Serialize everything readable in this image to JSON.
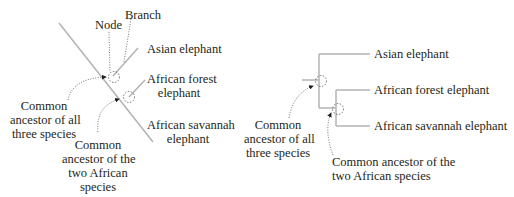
{
  "left_diagram": {
    "labels": {
      "node": "Node",
      "branch": "Branch",
      "asian": "Asian elephant",
      "forest_line1": "African forest",
      "forest_line2": "elephant",
      "savannah_line1": "African savannah",
      "savannah_line2": "elephant",
      "ancestor_all_1": "Common",
      "ancestor_all_2": "ancestor of all",
      "ancestor_all_3": "three species",
      "ancestor_african_1": "Common",
      "ancestor_african_2": "ancestor of the",
      "ancestor_african_3": "two African",
      "ancestor_african_4": "species"
    }
  },
  "right_diagram": {
    "labels": {
      "asian": "Asian elephant",
      "forest": "African forest elephant",
      "savannah": "African savannah elephant",
      "ancestor_all_1": "Common",
      "ancestor_all_2": "ancestor of all",
      "ancestor_all_3": "three species",
      "ancestor_african_1": "Common ancestor of the",
      "ancestor_african_2": "two African species"
    }
  },
  "colors": {
    "branch_line": "#b3b3b3",
    "text": "#231f20",
    "dotted": "#555555"
  }
}
